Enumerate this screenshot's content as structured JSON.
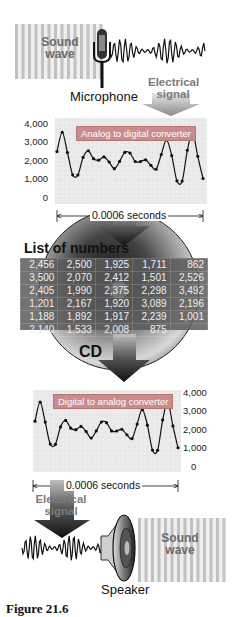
{
  "figure": {
    "caption": "Figure 21.6",
    "top": {
      "sound_wave_label_line1": "Sound",
      "sound_wave_label_line2": "wave",
      "microphone_label": "Microphone",
      "electrical_signal_line1": "Electrical",
      "electrical_signal_line2": "signal"
    },
    "adc_chart": {
      "converter_label": "Analog to digital converter",
      "y_ticks": [
        "4,000",
        "3,000",
        "2,000",
        "1,000",
        "0"
      ],
      "duration_label": "0.0006 seconds"
    },
    "storage": {
      "list_title": "List of numbers",
      "cd_label": "CD",
      "table_rows": [
        [
          "2,456",
          "2,500",
          "1,925",
          "1,711",
          "862"
        ],
        [
          "3,500",
          "2,070",
          "2,412",
          "1,501",
          "2,526"
        ],
        [
          "2,405",
          "1,990",
          "2,375",
          "2,298",
          "3,492"
        ],
        [
          "1,201",
          "2,167",
          "1,920",
          "3,089",
          "2,196"
        ],
        [
          "1,188",
          "1,892",
          "1,917",
          "2,239",
          "1,001"
        ],
        [
          "2,140",
          "1,533",
          "2,008",
          "875",
          ""
        ]
      ]
    },
    "dac_chart": {
      "converter_label": "Digital to analog converter",
      "y_ticks": [
        "4,000",
        "3,000",
        "2,000",
        "1,000",
        "0"
      ],
      "duration_label": "0.0006 seconds"
    },
    "bottom": {
      "electrical_signal_line1": "Electrical",
      "electrical_signal_line2": "signal",
      "speaker_label": "Speaker",
      "sound_wave_label_line1": "Sound",
      "sound_wave_label_line2": "wave"
    },
    "colors": {
      "converter_box": "#c98b8b",
      "plot_bg": "#ececec",
      "grid": "#d6d6d6",
      "curve": "#111111",
      "table_bg": "#5a5a5a",
      "electrical_label": "#7b7b7b"
    }
  },
  "chart_data": {
    "type": "line",
    "xlabel": "0.0006 seconds",
    "ylabel": "",
    "ylim": [
      0,
      4000
    ],
    "y_ticks": [
      0,
      1000,
      2000,
      3000,
      4000
    ],
    "grid": true,
    "series": [
      {
        "name": "Sampled values",
        "values": [
          2456,
          3500,
          2405,
          1201,
          1188,
          2140,
          2500,
          2070,
          1990,
          2167,
          1892,
          1533,
          1925,
          2412,
          2375,
          1920,
          1917,
          2008,
          1711,
          1501,
          2298,
          3089,
          2239,
          875,
          862,
          2526,
          3492,
          2196,
          1001
        ]
      }
    ]
  }
}
